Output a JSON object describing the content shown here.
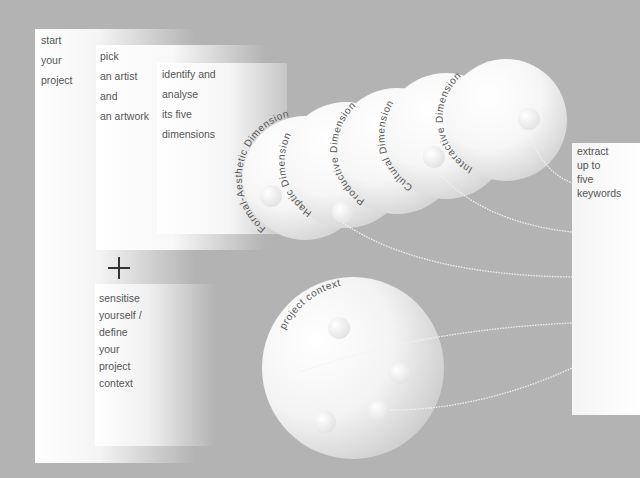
{
  "steps": {
    "start": {
      "lines": [
        "start",
        "your",
        "project"
      ]
    },
    "pick": {
      "lines": [
        "pick",
        "an artist",
        "and",
        "an artwork"
      ]
    },
    "identify": {
      "lines": [
        "identify and",
        "analyse",
        "its five",
        "dimensions"
      ]
    },
    "context": {
      "lines": [
        "sensitise",
        "yourself /",
        "define",
        "your",
        "project",
        "context"
      ]
    },
    "extract": {
      "lines": [
        "extract",
        "up to",
        "five",
        "keywords"
      ]
    }
  },
  "connector": {
    "symbol": "plus-icon"
  },
  "dimensions": [
    {
      "label": "Formal-Aesthetic Dimension"
    },
    {
      "label": "Haptic Dimension"
    },
    {
      "label": "Productive Dimension"
    },
    {
      "label": "Cultural Dimension"
    },
    {
      "label": "Interactive Dimension"
    }
  ],
  "context_circle": {
    "label": "project context"
  },
  "colors": {
    "background": "#b3b3b3",
    "panel": "#ffffff",
    "text": "#555555",
    "curve": "#f2f2f2"
  }
}
